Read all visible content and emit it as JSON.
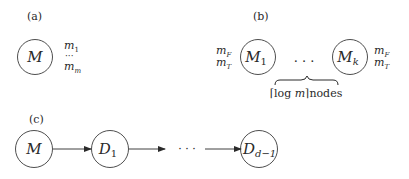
{
  "panels": {
    "a": {
      "label": "(a)",
      "node": {
        "name": "M"
      },
      "messages": {
        "first": "m",
        "first_sub": "1",
        "dots": "···",
        "last": "m",
        "last_sub": "m"
      }
    },
    "b": {
      "label": "(b)",
      "left_node": {
        "name": "M",
        "sub": "1"
      },
      "right_node": {
        "name": "M",
        "sub": "k"
      },
      "left_msgs": {
        "top": "m",
        "top_sub": "F",
        "bottom": "m",
        "bottom_sub": "T"
      },
      "right_msgs": {
        "top": "m",
        "top_sub": "F",
        "bottom": "m",
        "bottom_sub": "T"
      },
      "dots": ". . .",
      "brace_label": {
        "open": "⌈",
        "expr": "log ",
        "var": "m",
        "close": "⌉",
        "suffix": "nodes"
      }
    },
    "c": {
      "label": "(c)",
      "nodes": [
        {
          "name": "M",
          "sub": ""
        },
        {
          "name": "D",
          "sub": "1"
        },
        {
          "name": "D",
          "sub": "d−1"
        }
      ],
      "dots": "· · ·"
    }
  },
  "colors": {
    "stroke": "#3a3a3a",
    "text": "#2a2a2a",
    "background": "#ffffff"
  }
}
